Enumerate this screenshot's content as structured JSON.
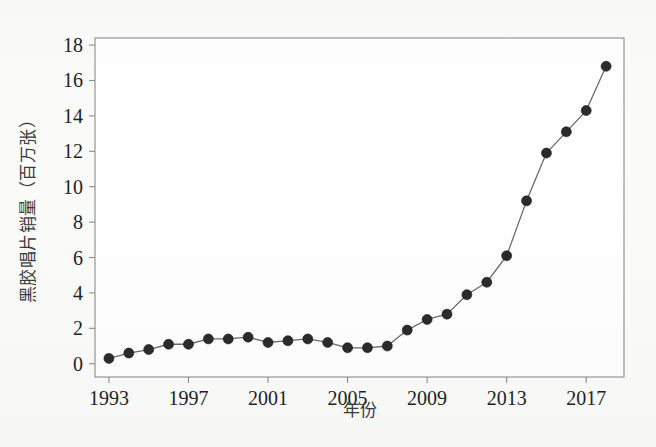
{
  "figure": {
    "background_color": "#fbfbfa",
    "plot_background_color": "#ffffff",
    "frame_color": "#8d8d8d",
    "line_color": "#6b6b6b",
    "marker_color": "#2b2b2b"
  },
  "chart_data": {
    "type": "line",
    "title": "",
    "subtitle": "",
    "xlabel": "年份",
    "ylabel": "黑胶唱片销量（百万张）",
    "xlim": [
      1992.3,
      2018.9
    ],
    "ylim": [
      -0.75,
      18.4
    ],
    "grid": false,
    "legend": null,
    "legend_position": "none",
    "xticks": [
      1993,
      1997,
      2001,
      2005,
      2009,
      2013,
      2017
    ],
    "xtick_labels": [
      "1993",
      "1997",
      "2001",
      "2005",
      "2009",
      "2013",
      "2017"
    ],
    "yticks": [
      0,
      2,
      4,
      6,
      8,
      10,
      12,
      14,
      16,
      18
    ],
    "ytick_labels": [
      "0",
      "2",
      "4",
      "6",
      "8",
      "10",
      "12",
      "14",
      "16",
      "18"
    ],
    "series": [
      {
        "name": "黑胶唱片销量",
        "marker": "circle",
        "x": [
          1993,
          1994,
          1995,
          1996,
          1997,
          1998,
          1999,
          2000,
          2001,
          2002,
          2003,
          2004,
          2005,
          2006,
          2007,
          2008,
          2009,
          2010,
          2011,
          2012,
          2013,
          2014,
          2015,
          2016,
          2017,
          2018
        ],
        "values": [
          0.3,
          0.6,
          0.8,
          1.1,
          1.1,
          1.4,
          1.4,
          1.5,
          1.2,
          1.3,
          1.4,
          1.2,
          0.9,
          0.9,
          1.0,
          1.9,
          2.5,
          2.8,
          3.9,
          4.6,
          6.1,
          9.2,
          11.9,
          13.1,
          14.3,
          16.8
        ]
      }
    ]
  }
}
